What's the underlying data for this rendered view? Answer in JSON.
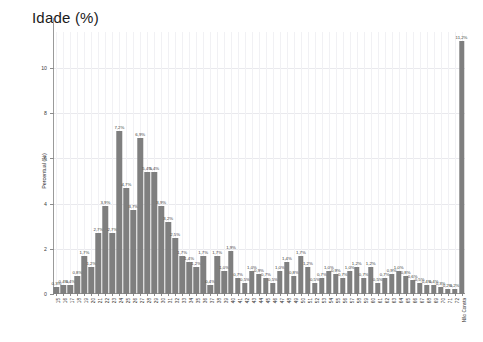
{
  "chart_data": {
    "type": "bar",
    "title": "Idade (%)",
    "xlabel": "",
    "ylabel": "Percentual (%)",
    "ylim": [
      0,
      11.6
    ],
    "yticks": [
      0,
      2,
      4,
      6,
      8,
      10
    ],
    "ytick_labels": [
      "0",
      "2",
      "4",
      "6",
      "8",
      "10"
    ],
    "grid": true,
    "legend": "none",
    "value_suffix": "%",
    "decimal_separator": ",",
    "bar_color": "#7f7f7f",
    "categories": [
      "15",
      "16",
      "17",
      "18",
      "19",
      "20",
      "21",
      "22",
      "23",
      "24",
      "25",
      "26",
      "27",
      "28",
      "29",
      "30",
      "31",
      "32",
      "33",
      "34",
      "35",
      "36",
      "37",
      "38",
      "39",
      "40",
      "41",
      "42",
      "43",
      "44",
      "45",
      "46",
      "47",
      "48",
      "49",
      "50",
      "51",
      "52",
      "53",
      "54",
      "55",
      "56",
      "57",
      "58",
      "59",
      "60",
      "61",
      "62",
      "63",
      "64",
      "65",
      "66",
      "67",
      "68",
      "69",
      "70",
      "71",
      "72",
      "Não Consta"
    ],
    "values": [
      0.3,
      0.4,
      0.4,
      0.8,
      1.7,
      1.2,
      2.7,
      3.9,
      2.7,
      7.2,
      4.7,
      3.7,
      6.9,
      5.4,
      5.4,
      3.9,
      3.2,
      2.5,
      1.7,
      1.4,
      1.2,
      1.7,
      0.4,
      1.7,
      1.0,
      1.9,
      0.7,
      0.5,
      1.0,
      0.9,
      0.7,
      0.5,
      1.0,
      1.4,
      0.8,
      1.7,
      1.2,
      0.5,
      0.7,
      1.0,
      0.9,
      0.7,
      1.0,
      1.2,
      0.7,
      1.2,
      0.5,
      0.7,
      0.9,
      1.0,
      0.8,
      0.6,
      0.5,
      0.4,
      0.4,
      0.3,
      0.2,
      0.2,
      11.2
    ],
    "value_labels": [
      "0,3%",
      "0,4%",
      "0,4%",
      "0,8%",
      "1,7%",
      "1,2%",
      "2,7%",
      "3,9%",
      "2,7%",
      "7,2%",
      "4,7%",
      "3,7%",
      "6,9%",
      "5,4%",
      "5,4%",
      "3,9%",
      "3,2%",
      "2,5%",
      "1,7%",
      "1,4%",
      "1,2%",
      "1,7%",
      "0,4%",
      "1,7%",
      "1,0%",
      "1,9%",
      "0,7%",
      "0,5%",
      "1,0%",
      "0,9%",
      "0,7%",
      "0,5%",
      "1,0%",
      "1,4%",
      "0,8%",
      "1,7%",
      "1,2%",
      "0,5%",
      "0,7%",
      "1,0%",
      "0,9%",
      "0,7%",
      "1,0%",
      "1,2%",
      "0,7%",
      "1,2%",
      "0,5%",
      "0,7%",
      "0,9%",
      "1,0%",
      "0,8%",
      "0,6%",
      "0,5%",
      "0,4%",
      "0,4%",
      "0,3%",
      "0,2%",
      "0,2%",
      "11,2%"
    ]
  }
}
